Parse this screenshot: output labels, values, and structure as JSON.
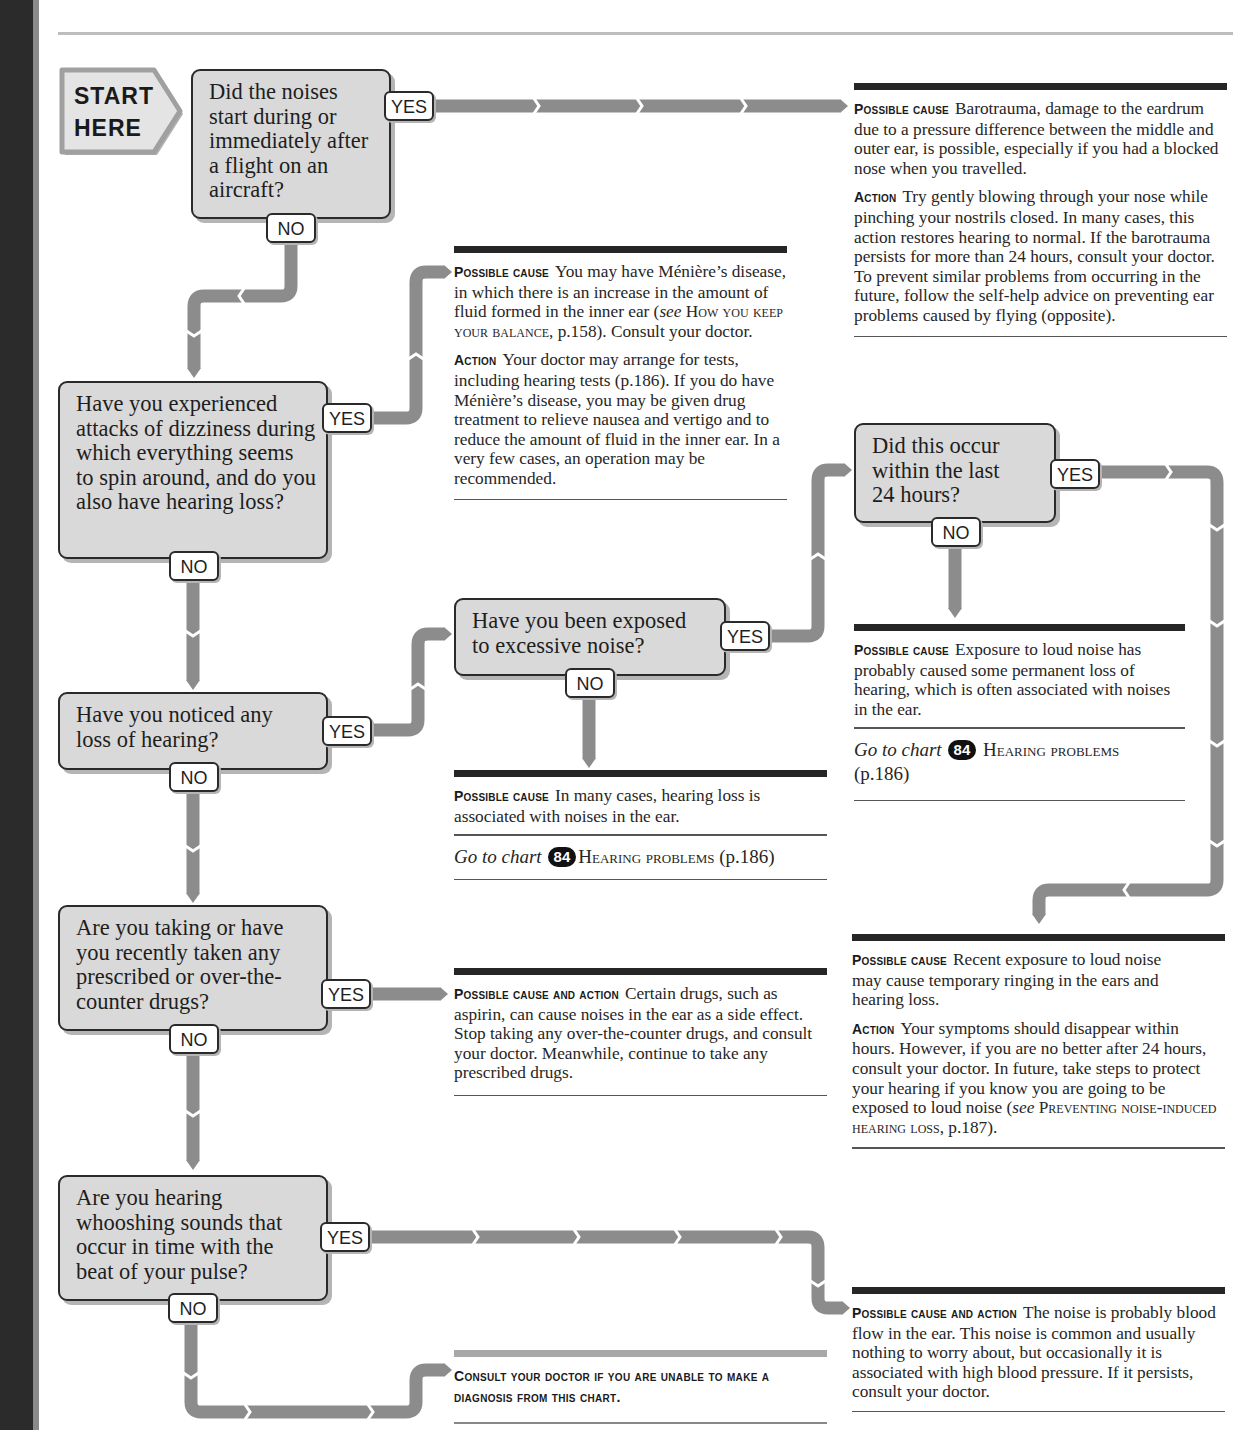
{
  "page": {
    "colors": {
      "box_fill": "#d9d9d9",
      "arrow": "#8c8c8c",
      "rule_dark": "#262626",
      "spine": "#2b2b2b"
    }
  },
  "start": {
    "label": "START\nHERE"
  },
  "labels": {
    "yes": "YES",
    "no": "NO"
  },
  "questions": [
    {
      "id": "q1",
      "text": "Did the noises start during or immediately after a flight on an aircraft?"
    },
    {
      "id": "q2",
      "text": "Have you experienced attacks of dizziness during which everything seems to spin around, and do you also have hearing loss?"
    },
    {
      "id": "q3",
      "text": "Have you noticed any loss of hearing?"
    },
    {
      "id": "q4",
      "text": "Have you been exposed to excessive noise?"
    },
    {
      "id": "q5",
      "text": "Did this occur within the last 24 hours?"
    },
    {
      "id": "q6",
      "text": "Are you taking or have you recently taken any prescribed or over-the-counter drugs?"
    },
    {
      "id": "q7",
      "text": "Are you hearing whooshing sounds that occur in time with the beat of your pulse?"
    }
  ],
  "outcomes": {
    "barotrauma": {
      "cause_label": "Possible cause",
      "cause_text": "Barotrauma, damage to the eardrum due to a pressure difference between the middle and outer ear, is possible, especially if you had a blocked nose when you travelled.",
      "action_label": "Action",
      "action_text": "Try gently blowing through your nose while pinching your nostrils closed. In many cases, this action restores hearing to normal. If the barotrauma persists for more than 24 hours, consult your doctor. To prevent similar problems from occurring in the future, follow the self-help advice on preventing ear problems caused by flying (opposite)."
    },
    "menieres": {
      "cause_label": "Possible cause",
      "cause_text_1": "You may have Ménière’s disease, in which there is an increase in the amount of fluid formed in the inner ear (",
      "cause_see": "see",
      "cause_ref": "How you keep your balance",
      "cause_text_2": ", p.158). Consult your doctor.",
      "action_label": "Action",
      "action_text": "Your doctor may arrange for tests, including hearing tests (p.186). If you do have Ménière’s disease, you may be given drug treatment to relieve nausea and vertigo and to reduce the amount of fluid in the inner ear. In a very few cases, an operation may be recommended."
    },
    "permanent_loss": {
      "cause_label": "Possible cause",
      "cause_text": "Exposure to loud noise has probably caused some permanent loss of hearing, which is often associated with noises in the ear.",
      "goto_text": "Go to chart",
      "goto_number": "84",
      "goto_title": "Hearing problems",
      "goto_page": "(p.186)"
    },
    "hearing_loss": {
      "cause_label": "Possible cause",
      "cause_text": "In many cases, hearing loss is associated with noises in the ear.",
      "goto_text": "Go to chart",
      "goto_number": "84",
      "goto_title": "Hearing problems",
      "goto_page": "(p.186)"
    },
    "recent_noise": {
      "cause_label": "Possible cause",
      "cause_text": "Recent exposure to loud noise may cause temporary ringing in the ears and hearing loss.",
      "action_label": "Action",
      "action_text_1": "Your symptoms should disappear within hours. However, if you are no better after 24 hours, consult your doctor. In future, take steps to protect your hearing if you know you are going to be exposed to loud noise (",
      "action_see": "see",
      "action_ref": "Preventing noise-induced hearing loss",
      "action_text_2": ", p.187)."
    },
    "drugs": {
      "label": "Possible cause and action",
      "text": "Certain drugs, such as aspirin, can cause noises in the ear as a side effect. Stop taking any over-the-counter drugs, and consult your doctor. Meanwhile, continue to take any prescribed drugs."
    },
    "blood_flow": {
      "label": "Possible cause and action",
      "text": "The noise is probably blood flow in the ear. This noise is common and usually nothing to worry about, but occasionally it is associated with high blood pressure. If it persists, consult your doctor."
    },
    "consult": {
      "text": "Consult your doctor if you are unable to make a diagnosis from this chart."
    }
  }
}
